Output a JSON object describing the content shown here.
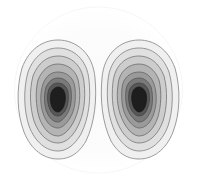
{
  "figure": {
    "title": "",
    "width": 197,
    "height": 180,
    "background_color": "#ffffff"
  },
  "chart_data": {
    "type": "heatmap",
    "title": "",
    "subtitle": "",
    "xlabel": "",
    "ylabel": "",
    "grid": false,
    "legend": "none",
    "axis_visible": false,
    "tick_labels_x": [],
    "tick_labels_y": [],
    "xlim": [
      0,
      197
    ],
    "ylim": [
      0,
      180
    ],
    "render_style": "filled-contour-with-lines",
    "colormap": "grayscale-reversed",
    "description": "Two-lobed scalar field rendered as nested filled contour bands, darkest at each lobe centre, fading to white at the outer boundary. The field is mirror-symmetric about the vertical mid-line.",
    "outer_boundary": {
      "shape": "ellipse",
      "center": [
        98.5,
        90
      ],
      "radius_x": 84,
      "radius_y": 83,
      "fill": "#fbfbfb",
      "stroke": "#f4f4f4"
    },
    "peaks": [
      {
        "name": "left-lobe",
        "center": [
          58,
          100
        ],
        "peak_value": 1.0,
        "orientation": "vertical",
        "bulge_direction": "left"
      },
      {
        "name": "right-lobe",
        "center": [
          129,
          100
        ],
        "peak_value": 1.0,
        "orientation": "vertical",
        "bulge_direction": "right"
      }
    ],
    "levels": [
      {
        "index": 0,
        "value": 0.1,
        "fill": "#f0f0f0",
        "stroke": "#8a8a8a",
        "rx": 40,
        "ry": 60
      },
      {
        "index": 1,
        "value": 0.22,
        "fill": "#e0e0e0",
        "stroke": "#7f7f7f",
        "rx": 34,
        "ry": 52
      },
      {
        "index": 2,
        "value": 0.34,
        "fill": "#cdcdcd",
        "stroke": "#757575",
        "rx": 29,
        "ry": 45
      },
      {
        "index": 3,
        "value": 0.46,
        "fill": "#b4b4b4",
        "stroke": "#6b6b6b",
        "rx": 24,
        "ry": 38
      },
      {
        "index": 4,
        "value": 0.58,
        "fill": "#9a9a9a",
        "stroke": "#606060",
        "rx": 19,
        "ry": 31
      },
      {
        "index": 5,
        "value": 0.7,
        "fill": "#7a7a7a",
        "stroke": "#515151",
        "rx": 15,
        "ry": 25
      },
      {
        "index": 6,
        "value": 0.82,
        "fill": "#575757",
        "stroke": "#3d3d3d",
        "rx": 12,
        "ry": 20
      },
      {
        "index": 7,
        "value": 0.94,
        "fill": "#1e1e1e",
        "stroke": "#141414",
        "rx": 9,
        "ry": 14
      }
    ],
    "level_count": 8,
    "value_range": [
      0.0,
      1.0
    ]
  }
}
